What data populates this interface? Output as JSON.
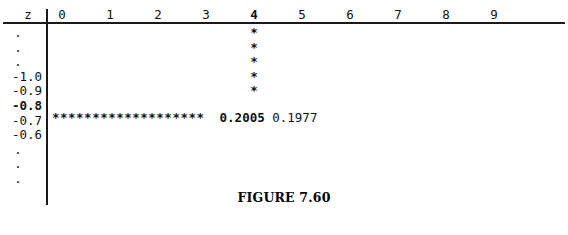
{
  "table": {
    "corner_label": "z",
    "column_headers": [
      "0",
      "1",
      "2",
      "3",
      "4",
      "5",
      "6",
      "7",
      "8",
      "9"
    ],
    "highlighted_column": "4",
    "row_labels": [
      ".",
      ".",
      ".",
      "-1.0",
      "-0.9",
      "-0.8",
      "-0.7",
      "-0.6",
      ".",
      ".",
      "."
    ],
    "highlighted_row": "-0.8",
    "pointer_column_stars": [
      "*",
      "*",
      "*",
      "*",
      "*"
    ],
    "pointer_row_stars": "*******************",
    "lookup_value": "0.2005",
    "neighbor_value": "0.1977"
  },
  "caption": {
    "text": "FIGURE 7.60"
  },
  "colors": {
    "ink": "#111111",
    "rule": "#1a1a1a",
    "background": "#ffffff"
  }
}
